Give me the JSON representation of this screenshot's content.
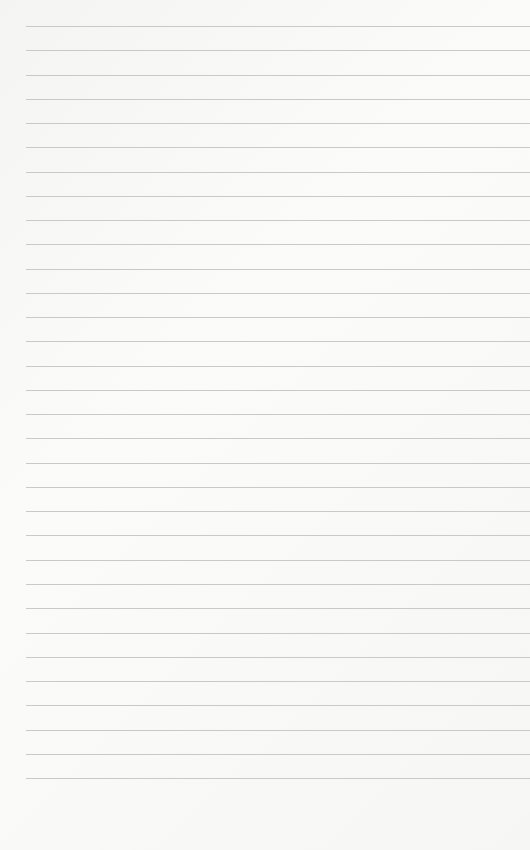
{
  "page": {
    "type": "lined-paper",
    "line_count": 32,
    "first_line_y": 26,
    "line_spacing": 24.26,
    "line_left": 26,
    "line_color": "#c9c9c7",
    "paper_color": "#f7f7f6"
  }
}
